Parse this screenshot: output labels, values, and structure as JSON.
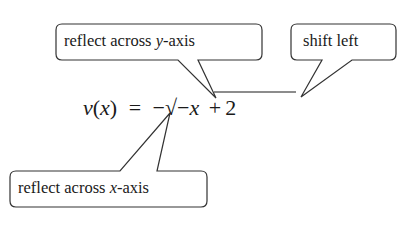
{
  "diagram": {
    "equation": {
      "lhs_func": "v",
      "lhs_paren_open": "(",
      "lhs_var": "x",
      "lhs_paren_close": ")",
      "equals": "=",
      "outer_sign": "−",
      "radical": "√",
      "inner_sign": "−",
      "inner_var": "x",
      "plus": "+",
      "constant": "2"
    },
    "callouts": [
      {
        "id": "reflect-y",
        "text_prefix": "reflect across ",
        "text_var": "y",
        "text_suffix": "-axis",
        "points_to": "inner minus sign"
      },
      {
        "id": "shift-left",
        "text": "shift left",
        "points_to": "+ 2"
      },
      {
        "id": "reflect-x",
        "text_prefix": "reflect across ",
        "text_var": "x",
        "text_suffix": "-axis",
        "points_to": "outer minus sign"
      }
    ],
    "colors": {
      "stroke": "#333333",
      "text": "#1a1a1a",
      "background": "#ffffff"
    }
  }
}
